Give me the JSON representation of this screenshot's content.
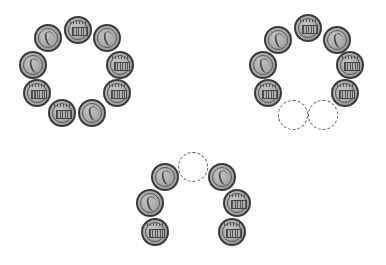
{
  "figure": {
    "coin_radius_px": 14,
    "colors": {
      "coin_fill": "#a6a6a6",
      "coin_rim": "#3a3a3a",
      "placeholder_stroke": "#555555",
      "background": "#ffffff"
    }
  },
  "groups": [
    {
      "name": "full-ring",
      "coin_count": 9,
      "missing_count": 0,
      "coins": [
        {
          "x": 78,
          "y": 30,
          "face": "tails"
        },
        {
          "x": 107,
          "y": 38,
          "face": "heads"
        },
        {
          "x": 120,
          "y": 65,
          "face": "tails"
        },
        {
          "x": 117,
          "y": 93,
          "face": "tails"
        },
        {
          "x": 92,
          "y": 113,
          "face": "heads"
        },
        {
          "x": 62,
          "y": 113,
          "face": "tails"
        },
        {
          "x": 37,
          "y": 93,
          "face": "tails"
        },
        {
          "x": 33,
          "y": 65,
          "face": "heads"
        },
        {
          "x": 48,
          "y": 38,
          "face": "heads"
        }
      ],
      "placeholders": []
    },
    {
      "name": "ring-missing-two-bottom",
      "coin_count": 7,
      "missing_count": 2,
      "coins": [
        {
          "x": 308,
          "y": 28,
          "face": "tails"
        },
        {
          "x": 337,
          "y": 40,
          "face": "heads"
        },
        {
          "x": 350,
          "y": 65,
          "face": "tails"
        },
        {
          "x": 345,
          "y": 93,
          "face": "tails"
        },
        {
          "x": 268,
          "y": 93,
          "face": "tails"
        },
        {
          "x": 263,
          "y": 65,
          "face": "heads"
        },
        {
          "x": 278,
          "y": 40,
          "face": "heads"
        }
      ],
      "placeholders": [
        {
          "x": 293,
          "y": 115
        },
        {
          "x": 323,
          "y": 115
        }
      ]
    },
    {
      "name": "arch-missing-top",
      "coin_count": 6,
      "missing_count": 1,
      "coins": [
        {
          "x": 165,
          "y": 177,
          "face": "heads"
        },
        {
          "x": 150,
          "y": 203,
          "face": "heads"
        },
        {
          "x": 155,
          "y": 232,
          "face": "tails"
        },
        {
          "x": 222,
          "y": 177,
          "face": "heads"
        },
        {
          "x": 237,
          "y": 203,
          "face": "tails"
        },
        {
          "x": 232,
          "y": 232,
          "face": "tails"
        }
      ],
      "placeholders": [
        {
          "x": 193,
          "y": 167
        }
      ]
    }
  ]
}
